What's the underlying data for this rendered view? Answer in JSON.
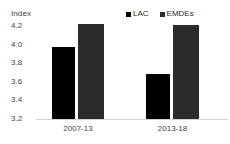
{
  "chart_data": {
    "type": "bar",
    "title": "",
    "subtitle": "",
    "xlabel": "",
    "ylabel": "Index",
    "categories": [
      "2007-13",
      "2013-18"
    ],
    "series": [
      {
        "name": "LAC",
        "color": "#000000",
        "values": [
          3.93,
          3.65
        ]
      },
      {
        "name": "EMDEs",
        "color": "#2b2b2b",
        "values": [
          4.16,
          4.15
        ]
      }
    ],
    "ylim": [
      3.2,
      4.2
    ],
    "yticks": [
      "4.2",
      "4.0",
      "3.8",
      "3.6",
      "3.4",
      "3.2"
    ],
    "ytick_values": [
      4.2,
      4.0,
      3.8,
      3.6,
      3.4,
      3.2
    ],
    "grid": false,
    "legend_position": "top-right",
    "legend": [
      {
        "label": "LAC",
        "marker": "square-swatch",
        "color": "#000000"
      },
      {
        "label": "EMDEs",
        "marker": "square-swatch",
        "color": "#2b2b2b"
      }
    ],
    "axis_line_color": "#d2d2d2",
    "text_color": "#3f3f3f"
  }
}
